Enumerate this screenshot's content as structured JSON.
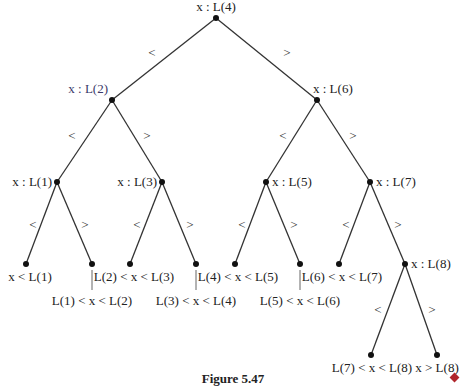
{
  "diagram": {
    "caption": "Figure 5.47",
    "end_marker_color": "#b0262c",
    "nodes": [
      {
        "id": "n4",
        "label": "x : L(4)",
        "x": 216,
        "y": 18
      },
      {
        "id": "n2",
        "label": "x : L(2)",
        "x": 112,
        "y": 100
      },
      {
        "id": "n6",
        "label": "x : L(6)",
        "x": 317,
        "y": 100
      },
      {
        "id": "n1",
        "label": "x : L(1)",
        "x": 57,
        "y": 182
      },
      {
        "id": "n3",
        "label": "x : L(3)",
        "x": 162,
        "y": 182
      },
      {
        "id": "n5",
        "label": "x : L(5)",
        "x": 266,
        "y": 182
      },
      {
        "id": "n7",
        "label": "x : L(7)",
        "x": 370,
        "y": 182
      },
      {
        "id": "n8",
        "label": "x : L(8)",
        "x": 405,
        "y": 264
      }
    ],
    "leaves": [
      {
        "label": "x < L(1)",
        "x": 26,
        "y": 264
      },
      {
        "label": "L(1) < x < L(2)",
        "x": 92,
        "y": 264
      },
      {
        "label": "L(2) < x < L(3)",
        "x": 130,
        "y": 264
      },
      {
        "label": "L(3) < x < L(4)",
        "x": 196,
        "y": 264
      },
      {
        "label": "L(4) < x < L(5)",
        "x": 235,
        "y": 264
      },
      {
        "label": "L(5) < x < L(6)",
        "x": 300,
        "y": 264
      },
      {
        "label": "L(6) < x < L(7)",
        "x": 339,
        "y": 264
      },
      {
        "label": "L(7) < x < L(8)",
        "x": 371,
        "y": 355
      },
      {
        "label": "x > L(8)",
        "x": 437,
        "y": 355
      }
    ],
    "edge_labels": {
      "less": "<",
      "greater": ">"
    }
  }
}
